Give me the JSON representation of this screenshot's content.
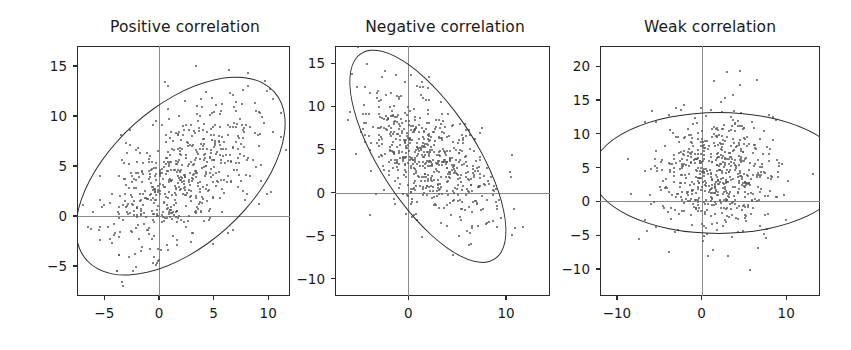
{
  "figure": {
    "width": 851,
    "height": 350,
    "background": "#ffffff",
    "dot_color": "#585858",
    "line_color": "#2b2b2b",
    "axis_crosshair_color": "#8a8a8a"
  },
  "chart_data": [
    {
      "type": "scatter",
      "title": "Positive correlation",
      "xlabel": "",
      "ylabel": "",
      "xlim": [
        -7.5,
        12.0
      ],
      "ylim": [
        -8.0,
        17.0
      ],
      "xticks": [
        -5,
        0,
        5,
        10
      ],
      "xticklabels": [
        "−5",
        "0",
        "5",
        "10"
      ],
      "yticks": [
        -5,
        0,
        5,
        10,
        15
      ],
      "yticklabels": [
        "−5",
        "0",
        "5",
        "10",
        "15"
      ],
      "grid": false,
      "legend": null,
      "n_points": 600,
      "center": [
        2.0,
        4.0
      ],
      "sd_x": 3.6,
      "sd_y": 3.9,
      "correlation": 0.55,
      "ellipse": {
        "center": [
          2.0,
          4.0
        ],
        "semi_major": 11.6,
        "semi_minor": 7.0,
        "angle_deg": 42,
        "description": "confidence ellipse tilted up to the right"
      },
      "seed": 11
    },
    {
      "type": "scatter",
      "title": "Negative correlation",
      "xlabel": "",
      "ylabel": "",
      "xlim": [
        -7.5,
        14.5
      ],
      "ylim": [
        -12.0,
        17.0
      ],
      "xticks": [
        0,
        10
      ],
      "xticklabels": [
        "0",
        "10"
      ],
      "yticks": [
        -10,
        -5,
        0,
        5,
        10,
        15
      ],
      "yticklabels": [
        "−10",
        "−5",
        "0",
        "5",
        "10",
        "15"
      ],
      "grid": false,
      "legend": null,
      "n_points": 600,
      "center": [
        2.0,
        4.2
      ],
      "sd_x": 3.3,
      "sd_y": 3.8,
      "correlation": -0.55,
      "ellipse": {
        "center": [
          2.0,
          4.2
        ],
        "semi_major": 12.6,
        "semi_minor": 5.6,
        "angle_deg": -57,
        "description": "confidence ellipse tilted down to the right"
      },
      "seed": 29
    },
    {
      "type": "scatter",
      "title": "Weak correlation",
      "xlabel": "",
      "ylabel": "",
      "xlim": [
        -12.0,
        14.0
      ],
      "ylim": [
        -14.0,
        23.0
      ],
      "xticks": [
        -10,
        0,
        10
      ],
      "xticklabels": [
        "−10",
        "0",
        "10"
      ],
      "yticks": [
        -10,
        -5,
        0,
        5,
        10,
        15,
        20
      ],
      "yticklabels": [
        "−10",
        "−5",
        "0",
        "5",
        "10",
        "15",
        "20"
      ],
      "grid": false,
      "legend": null,
      "n_points": 600,
      "center": [
        2.0,
        4.0
      ],
      "sd_x": 3.5,
      "sd_y": 4.6,
      "correlation": 0.05,
      "ellipse": {
        "center": [
          2.0,
          4.2
        ],
        "semi_major": 15.0,
        "semi_minor": 9.0,
        "angle_deg": 0,
        "description": "near-circular confidence ellipse, no tilt"
      },
      "seed": 47
    }
  ]
}
